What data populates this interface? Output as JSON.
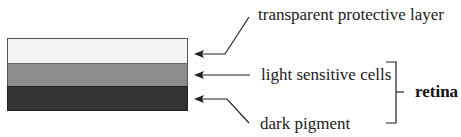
{
  "diagram": {
    "layers": [
      {
        "name": "transparent-protective-layer",
        "color": "#f3f3f3"
      },
      {
        "name": "light-sensitive-cells",
        "color": "#8c8c8c"
      },
      {
        "name": "dark-pigment",
        "color": "#333333"
      }
    ],
    "labels": {
      "top": "transparent protective layer",
      "middle": "light sensitive cells",
      "bottom": "dark pigment",
      "group": "retina"
    },
    "line_color": "#222222"
  }
}
